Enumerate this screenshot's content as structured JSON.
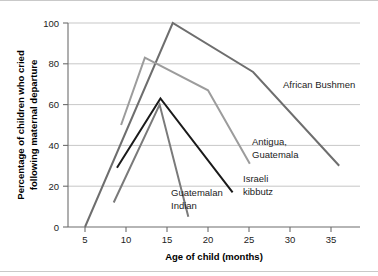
{
  "chart_data": {
    "type": "line",
    "title": "",
    "xlabel": "Age of child (months)",
    "ylabel": "Percentage of children who cried following maternal departure",
    "xlim": [
      3,
      38
    ],
    "ylim": [
      0,
      100
    ],
    "xticks": [
      5,
      10,
      15,
      20,
      25,
      30,
      35
    ],
    "xtick_labels": [
      "5",
      "10",
      "15",
      "20",
      "25",
      "30",
      "35"
    ],
    "yticks": [
      0,
      20,
      40,
      60,
      80,
      100
    ],
    "ytick_labels": [
      "0",
      "20",
      "40",
      "60",
      "80",
      "100"
    ],
    "grid": "horizontal",
    "legend": "inline-labels",
    "series": [
      {
        "name": "African Bushmen",
        "color": "#6e6e6e",
        "width": 2.0,
        "x": [
          5,
          15.7,
          25.5,
          36
        ],
        "y": [
          0,
          100,
          76,
          30
        ],
        "label_x": 283,
        "label_y": 88
      },
      {
        "name": "Antigua, Guatemala",
        "color": "#9c9c9c",
        "width": 2.0,
        "x": [
          9.4,
          12.3,
          20,
          25.1
        ],
        "y": [
          50,
          83,
          67,
          31
        ],
        "label_line1_x": 252,
        "label_line1_y": 145,
        "label_line2_x": 252,
        "label_line2_y": 158
      },
      {
        "name": "Israeli kibbutz",
        "color": "#1a1a1a",
        "width": 2.0,
        "x": [
          8.9,
          14.2,
          23
        ],
        "y": [
          29,
          63,
          17
        ],
        "label_line1_x": 243,
        "label_line1_y": 182,
        "label_line2_x": 243,
        "label_line2_y": 195
      },
      {
        "name": "Guatemalan Indian",
        "color": "#7a7a7a",
        "width": 2.0,
        "x": [
          8.5,
          14.1,
          17.6
        ],
        "y": [
          12,
          60,
          5
        ],
        "label_line1_x": 171,
        "label_line1_y": 196,
        "label_line2_x": 171,
        "label_line2_y": 209
      }
    ],
    "labels": {
      "african_bushmen": "African Bushmen",
      "antigua_line1": "Antigua,",
      "antigua_line2": "Guatemala",
      "israeli_line1": "Israeli",
      "israeli_line2": "kibbutz",
      "guatemalan_line1": "Guatemalan",
      "guatemalan_line2": "Indian"
    },
    "y_axis_title_line1": "Percentage of children who cried",
    "y_axis_title_line2": "following maternal departure"
  }
}
